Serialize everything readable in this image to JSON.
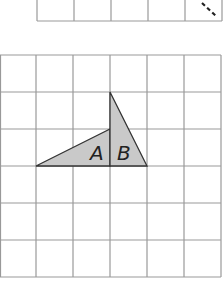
{
  "diagram": {
    "top_grid": {
      "cols": 5,
      "rows": 1,
      "partial": true
    },
    "main_grid": {
      "cols": 6,
      "rows": 6
    },
    "shapes": [
      {
        "label": "A",
        "type": "triangle",
        "points": "36,166 110,129 110,166"
      },
      {
        "label": "B",
        "type": "triangle",
        "points": "110,92 110,166 147,166"
      }
    ],
    "labels": {
      "a": "A",
      "b": "B"
    },
    "colors": {
      "grid": "#999999",
      "fill": "#c9c9c9",
      "edge": "#333333"
    }
  }
}
